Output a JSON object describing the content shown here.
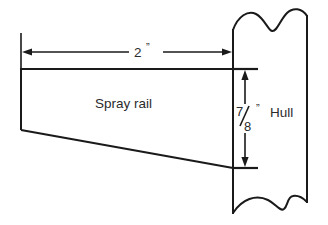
{
  "diagram": {
    "background_color": "#ffffff",
    "line_color": "#1a1a1a",
    "text_color": "#2b2b2b",
    "labels": {
      "spray_rail": "Spray rail",
      "hull": "Hull",
      "width_dimension": "2",
      "width_unit_mark": "”",
      "height_numerator": "7",
      "height_denominator": "8",
      "height_unit_mark": "”"
    },
    "dimensions": {
      "width_value": "2”",
      "height_value": "7/8”"
    },
    "icons": {
      "arrow_left": "arrow-left-icon",
      "arrow_right": "arrow-right-icon",
      "arrow_up": "arrow-up-icon",
      "arrow_down": "arrow-down-icon"
    }
  }
}
